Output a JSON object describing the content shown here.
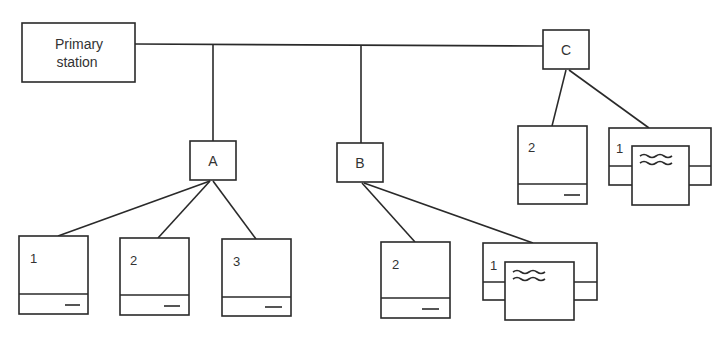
{
  "diagram": {
    "type": "network-topology",
    "primary_station": {
      "label_line1": "Primary",
      "label_line2": "station"
    },
    "nodes": {
      "A": {
        "label": "A",
        "children": [
          {
            "type": "terminal",
            "label": "1"
          },
          {
            "type": "terminal",
            "label": "2"
          },
          {
            "type": "terminal",
            "label": "3"
          }
        ]
      },
      "B": {
        "label": "B",
        "children": [
          {
            "type": "terminal",
            "label": "2"
          },
          {
            "type": "printer",
            "label": "1"
          }
        ]
      },
      "C": {
        "label": "C",
        "children": [
          {
            "type": "terminal",
            "label": "2"
          },
          {
            "type": "printer",
            "label": "1"
          }
        ]
      }
    },
    "colors": {
      "stroke": "#2a2a2a",
      "text": "#333333",
      "background": "#ffffff"
    }
  }
}
